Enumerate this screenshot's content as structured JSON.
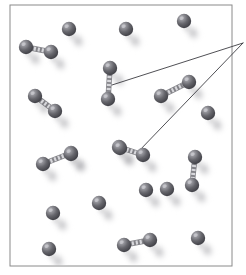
{
  "figure": {
    "width": 246,
    "height": 275,
    "background_color": "#ffffff"
  },
  "frame": {
    "name": "sample-frame",
    "x": 10,
    "y": 5,
    "width": 222,
    "height": 261,
    "stroke_color": "#8a8a8a",
    "stroke_width": 1,
    "fill_color": "#ffffff"
  },
  "style": {
    "atom_fill_dark": "#4a4a4f",
    "atom_fill_mid": "#64646a",
    "atom_fill_light": "#9a9aa0",
    "atom_highlight": "#c8c8cd",
    "atom_radius": 7.2,
    "shadow_color": "#b4b4b8",
    "bond_color": "#d8d8dc",
    "bond_edge_color": "#6e6e74",
    "leader_line_color": "#3c3c42",
    "leader_line_width": 0.9
  },
  "leader_lines": [
    {
      "name": "leader-line-upper",
      "from_x": 112,
      "from_y": 85,
      "to_x": 243,
      "to_y": 43
    },
    {
      "name": "leader-line-lower",
      "from_x": 138,
      "from_y": 152,
      "to_x": 243,
      "to_y": 43
    }
  ],
  "callout_vertex": {
    "name": "callout-vertex",
    "x": 243,
    "y": 43
  },
  "molecules": [
    {
      "name": "molecule-top-left-pair",
      "type": "diatomic",
      "atoms": [
        {
          "x": 26,
          "y": 47
        },
        {
          "x": 51,
          "y": 52
        }
      ]
    },
    {
      "name": "molecule-left-upper-pair",
      "type": "diatomic",
      "atoms": [
        {
          "x": 35,
          "y": 96
        },
        {
          "x": 55,
          "y": 111
        }
      ]
    },
    {
      "name": "molecule-center-vertical-pair",
      "type": "diatomic",
      "atoms": [
        {
          "x": 110,
          "y": 68
        },
        {
          "x": 108,
          "y": 99
        }
      ]
    },
    {
      "name": "molecule-right-upper-pair",
      "type": "diatomic",
      "atoms": [
        {
          "x": 161,
          "y": 96
        },
        {
          "x": 189,
          "y": 82
        }
      ]
    },
    {
      "name": "molecule-left-middle-pair",
      "type": "diatomic",
      "atoms": [
        {
          "x": 43,
          "y": 164
        },
        {
          "x": 71,
          "y": 153
        }
      ]
    },
    {
      "name": "molecule-center-middle-pair",
      "type": "diatomic",
      "atoms": [
        {
          "x": 119,
          "y": 147
        },
        {
          "x": 143,
          "y": 155
        }
      ]
    },
    {
      "name": "molecule-right-vertical-pair",
      "type": "diatomic",
      "atoms": [
        {
          "x": 195,
          "y": 157
        },
        {
          "x": 192,
          "y": 185
        }
      ]
    },
    {
      "name": "molecule-bottom-center-pair",
      "type": "diatomic",
      "atoms": [
        {
          "x": 124,
          "y": 245
        },
        {
          "x": 150,
          "y": 240
        }
      ]
    }
  ],
  "single_atoms": [
    {
      "name": "atom-top-1",
      "x": 69,
      "y": 29
    },
    {
      "name": "atom-top-2",
      "x": 126,
      "y": 29
    },
    {
      "name": "atom-top-3",
      "x": 184,
      "y": 21
    },
    {
      "name": "atom-right-1",
      "x": 208,
      "y": 113
    },
    {
      "name": "atom-center-1",
      "x": 120,
      "y": 148
    },
    {
      "name": "atom-middle-left-1",
      "x": 71,
      "y": 154
    },
    {
      "name": "atom-middle-right-1",
      "x": 167,
      "y": 189
    },
    {
      "name": "atom-center-low-1",
      "x": 99,
      "y": 203
    },
    {
      "name": "atom-left-low-1",
      "x": 53,
      "y": 213
    },
    {
      "name": "atom-left-bottom-1",
      "x": 49,
      "y": 249
    },
    {
      "name": "atom-right-bottom-1",
      "x": 198,
      "y": 238
    },
    {
      "name": "atom-right-mid-2",
      "x": 146,
      "y": 190
    }
  ]
}
